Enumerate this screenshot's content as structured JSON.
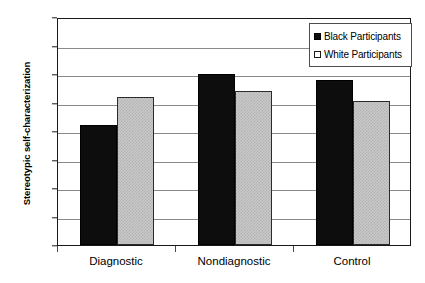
{
  "chart_data": {
    "type": "bar",
    "title": "",
    "xlabel": "",
    "ylabel": "Stereotypic self-characterization",
    "categories": [
      "Diagnostic",
      "Nondiagnostic",
      "Control"
    ],
    "series": [
      {
        "name": "Black Participants",
        "values": [
          21,
          30,
          29
        ],
        "color": "#0d0d0d"
      },
      {
        "name": "White Participants",
        "values": [
          26,
          27,
          25.3
        ],
        "color": "#c9c9c9"
      }
    ],
    "ylim": [
      0,
      40
    ],
    "ytick_labels": [
      "0",
      "5",
      "10",
      "15",
      "20",
      "25",
      "30",
      "35",
      "40"
    ],
    "ytick_values": [
      0,
      5,
      10,
      15,
      20,
      25,
      30,
      35,
      40
    ],
    "grid": "horizontal",
    "legend_position": "top-right",
    "legend_entries": [
      {
        "label": "Black Participants",
        "swatch": "filled-black-square"
      },
      {
        "label": "White Participants",
        "swatch": "outlined-white-square"
      }
    ]
  },
  "colors": {
    "series_black": "#0d0d0d",
    "series_white": "#c9c9c9",
    "axis": "#1a1a1a",
    "gridline": "#8a8a8a",
    "background": "#ffffff"
  }
}
